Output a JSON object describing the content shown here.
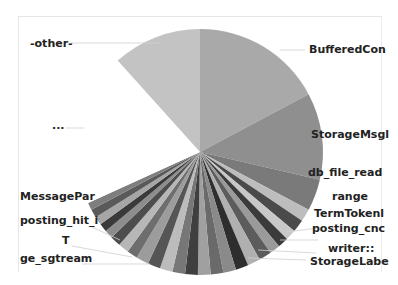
{
  "chart_data": {
    "type": "pie",
    "title": "",
    "center": [
      200,
      152
    ],
    "radius": 123,
    "slices": [
      {
        "label": "BufferedCon",
        "start": 0,
        "end": 62,
        "color": "#a9a9a9"
      },
      {
        "label": "StorageMsgl",
        "start": 62,
        "end": 103,
        "color": "#8f8f8f"
      },
      {
        "label": "db_file_read",
        "start": 103,
        "end": 118,
        "color": "#7a7a7a"
      },
      {
        "label": "range",
        "start": 118,
        "end": 124,
        "color": "#bdbdbd"
      },
      {
        "label": "TermTokenl",
        "start": 124,
        "end": 130,
        "color": "#4a4a4a"
      },
      {
        "label": "posting_cnc",
        "start": 130,
        "end": 135,
        "color": "#c8c8c8"
      },
      {
        "label": "writer::",
        "start": 135,
        "end": 140,
        "color": "#3b3b3b"
      },
      {
        "label": "StorageLabe",
        "start": 140,
        "end": 145,
        "color": "#9a9a9a"
      },
      {
        "label": "",
        "start": 145,
        "end": 151,
        "color": "#5c5c5c"
      },
      {
        "label": "",
        "start": 151,
        "end": 157,
        "color": "#b0b0b0"
      },
      {
        "label": "",
        "start": 157,
        "end": 163,
        "color": "#2e2e2e"
      },
      {
        "label": "",
        "start": 163,
        "end": 169,
        "color": "#8a8a8a"
      },
      {
        "label": "",
        "start": 169,
        "end": 175,
        "color": "#6a6a6a"
      },
      {
        "label": "",
        "start": 175,
        "end": 181,
        "color": "#a0a0a0"
      },
      {
        "label": "ge_sgtream",
        "start": 181,
        "end": 187,
        "color": "#3f3f3f"
      },
      {
        "label": "",
        "start": 187,
        "end": 193,
        "color": "#777777"
      },
      {
        "label": "T",
        "start": 193,
        "end": 199,
        "color": "#bcbcbc"
      },
      {
        "label": "",
        "start": 199,
        "end": 205,
        "color": "#555555"
      },
      {
        "label": "",
        "start": 205,
        "end": 211,
        "color": "#9c9c9c"
      },
      {
        "label": "posting_hit_i",
        "start": 211,
        "end": 216,
        "color": "#6e6e6e"
      },
      {
        "label": "",
        "start": 216,
        "end": 221,
        "color": "#b7b7b7"
      },
      {
        "label": "",
        "start": 221,
        "end": 226,
        "color": "#4d4d4d"
      },
      {
        "label": "",
        "start": 226,
        "end": 230,
        "color": "#8d8d8d"
      },
      {
        "label": "",
        "start": 230,
        "end": 234,
        "color": "#3a3a3a"
      },
      {
        "label": "",
        "start": 234,
        "end": 238,
        "color": "#a6a6a6"
      },
      {
        "label": "MessagePar",
        "start": 238,
        "end": 242,
        "color": "#5a5a5a"
      },
      {
        "label": "",
        "start": 242,
        "end": 245.5,
        "color": "#7e7e7e"
      },
      {
        "label": "...",
        "start": 245.5,
        "end": 318,
        "color": "#ffffff"
      },
      {
        "label": "-other-",
        "start": 318,
        "end": 360,
        "color": "#c3c3c3"
      }
    ]
  },
  "labels": {
    "other": "-other-",
    "ellipsis": "...",
    "buffered": "BufferedCon",
    "storagemsg": "StorageMsgl",
    "dbfile": "db_file_read",
    "range": "range",
    "termtoken": "TermTokenl",
    "postingcnc": "posting_cnc",
    "writer": "writer::",
    "storagelabe": "StorageLabe",
    "messagepar": "MessagePar",
    "postinghit": "posting_hit_i",
    "t": "T",
    "gestream": "ge_sgtream"
  }
}
